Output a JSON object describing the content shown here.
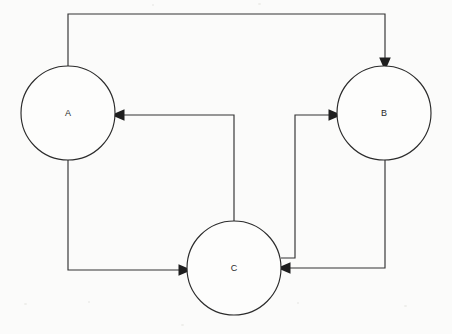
{
  "diagram": {
    "background_color": "#fbfbfa",
    "stroke_color": "#333333",
    "node_fill_color": "#fdfdfc",
    "node_stroke_color": "#2b2b2b",
    "arrow_color": "#1e1e1e",
    "top_cropped_text": "",
    "nodes": [
      {
        "id": "A",
        "label": "A",
        "cx": 68,
        "cy": 113,
        "r": 47
      },
      {
        "id": "B",
        "label": "B",
        "cx": 384,
        "cy": 113,
        "r": 47
      },
      {
        "id": "C",
        "label": "C",
        "cx": 234,
        "cy": 268,
        "r": 47
      }
    ],
    "edges": [
      {
        "id": "a-to-b",
        "from": "A",
        "to": "B",
        "label": "",
        "direction": "A to B",
        "arrow_at": "top-of-B",
        "path": "M 68 66 L 68 14 L 385 14 L 385 60"
      },
      {
        "id": "c-to-a",
        "from": "C",
        "to": "A",
        "label": "",
        "direction": "C to A",
        "arrow_at": "right-of-A",
        "path": "M 234 221 L 234 115 L 122 115"
      },
      {
        "id": "c-to-b",
        "from": "C",
        "to": "B",
        "label": "",
        "direction": "C to B",
        "arrow_at": "left-of-B",
        "path": "M 281 258 L 295 258 L 295 115 L 331 115"
      },
      {
        "id": "a-to-c",
        "from": "A",
        "to": "C",
        "label": "",
        "direction": "A to C",
        "arrow_at": "left-of-C",
        "path": "M 68 160 L 68 270 L 181 270"
      },
      {
        "id": "b-to-c",
        "from": "B",
        "to": "C",
        "label": "",
        "direction": "B to C",
        "arrow_at": "right-of-C",
        "path": "M 385 160 L 385 268 L 288 268"
      }
    ]
  }
}
